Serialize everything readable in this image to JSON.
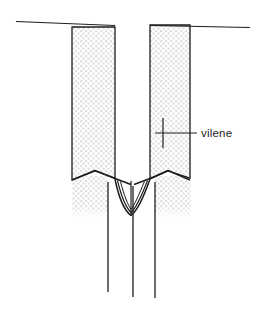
{
  "figure": {
    "type": "line-drawing",
    "background_color": "#ffffff",
    "ink_color": "#1d1d1d",
    "stipple_color": "#8c8c8c",
    "annotations": [
      {
        "id": "vilene",
        "label": "vilene",
        "label_x": 203,
        "label_y": 137,
        "leader_from_x": 163,
        "leader_from_y": 133,
        "leader_to_x": 197,
        "leader_to_y": 133,
        "tick_x": 163,
        "tick_top_y": 118,
        "tick_bottom_y": 148
      }
    ],
    "geometry": {
      "top_line_left": {
        "x1": 16,
        "y1": 22,
        "x2": 115,
        "y2": 25
      },
      "top_line_right": {
        "x1": 150,
        "y1": 25,
        "x2": 250,
        "y2": 27
      },
      "left_band": {
        "outline": "M72,27 L115,27 L115,178 L95,171 L72,180 Z",
        "fill": "stipple",
        "top_y": 27,
        "bottom_y": 180,
        "x_left": 72,
        "x_right": 115
      },
      "right_band": {
        "outline": "M150,25 L190,25 L190,180 L168,171 L150,178 Z",
        "fill": "stipple",
        "top_y": 25,
        "bottom_y": 180,
        "x_left": 150,
        "x_right": 190
      },
      "left_tail_stipple": {
        "x": 72,
        "y": 180,
        "w": 36,
        "h": 36
      },
      "right_tail_stipple": {
        "x": 155,
        "y": 180,
        "w": 36,
        "h": 36
      },
      "seam_fold_left": "M72,180 L95,171 L115,179 L131,184",
      "seam_fold_right": "M190,180 L168,171 L150,179 L134,184",
      "pouch_outer": "M115,179 C120,200 126,212 131,215 C136,212 142,200 150,179",
      "pouch_inner": "M117,180 C122,198 127,209 131,212 C136,209 141,198 148,180",
      "pouch_mid": "M120,181 C124,196 128,206 131,209 C135,206 139,196 145,181",
      "center_stitch": {
        "x": 131,
        "y1": 181,
        "y2": 215
      },
      "vertical_lines": [
        {
          "name": "left-seam-line",
          "x": 108,
          "y1": 182,
          "y2": 292
        },
        {
          "name": "center-seam-line",
          "x": 133,
          "y1": 183,
          "y2": 297
        },
        {
          "name": "right-seam-line",
          "x": 155,
          "y1": 182,
          "y2": 298
        }
      ]
    }
  }
}
